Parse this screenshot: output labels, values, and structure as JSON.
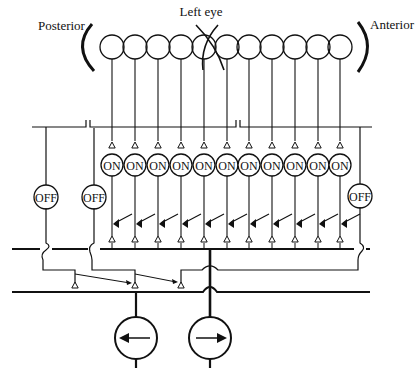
{
  "labels": {
    "posterior": "Posterior",
    "left_eye": "Left eye",
    "anterior": "Anterior"
  },
  "node_labels": {
    "on": "ON",
    "off": "OFF"
  },
  "colors": {
    "ink": "#111111",
    "background": "#ffffff"
  },
  "receptors": {
    "count": 11,
    "x": [
      112,
      135,
      158,
      181,
      204,
      227,
      249,
      272,
      295,
      318,
      340
    ],
    "y": 47,
    "r": 12
  },
  "on_units": {
    "count": 11,
    "y": 165,
    "r": 11
  },
  "off_units": [
    {
      "x": 46,
      "y": 197,
      "label": "OFF"
    },
    {
      "x": 94,
      "y": 197,
      "label": "OFF"
    },
    {
      "x": 360,
      "y": 196,
      "label": "OFF"
    }
  ],
  "motor_units": [
    {
      "x": 136,
      "y": 338,
      "direction": "left",
      "icon": "arrow-left-icon"
    },
    {
      "x": 210,
      "y": 338,
      "direction": "right",
      "icon": "arrow-right-icon"
    }
  ]
}
